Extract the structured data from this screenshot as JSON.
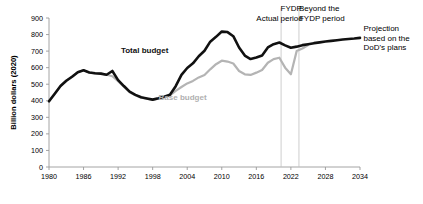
{
  "chart_data": {
    "type": "line",
    "title": "",
    "xlabel": "",
    "ylabel": "Billion dollars (2020)",
    "xlim": [
      1980,
      2034
    ],
    "ylim": [
      0,
      900
    ],
    "xticks": [
      1980,
      1986,
      1992,
      1998,
      2004,
      2010,
      2016,
      2022,
      2028,
      2034
    ],
    "yticks": [
      0,
      100,
      200,
      300,
      400,
      500,
      600,
      700,
      800,
      900
    ],
    "grid": false,
    "legend_position": "inline-labels",
    "series": [
      {
        "name": "Total budget",
        "color": "#111111",
        "x": [
          1980,
          1981,
          1982,
          1983,
          1984,
          1985,
          1986,
          1987,
          1988,
          1989,
          1990,
          1991,
          1992,
          1993,
          1994,
          1995,
          1996,
          1997,
          1998,
          1999,
          2000,
          2001,
          2002,
          2003,
          2004,
          2005,
          2006,
          2007,
          2008,
          2009,
          2010,
          2011,
          2012,
          2013,
          2014,
          2015,
          2016,
          2017,
          2018,
          2019,
          2020,
          2021,
          2022,
          2023,
          2024,
          2025,
          2026,
          2027,
          2028,
          2029,
          2030,
          2031,
          2032,
          2033,
          2034
        ],
        "y": [
          397,
          443,
          489,
          521,
          545,
          573,
          584,
          571,
          566,
          564,
          557,
          580,
          525,
          489,
          455,
          436,
          421,
          414,
          407,
          415,
          425,
          437,
          488,
          556,
          598,
          626,
          669,
          702,
          757,
          786,
          818,
          815,
          790,
          722,
          673,
          652,
          661,
          674,
          722,
          742,
          752,
          735,
          720,
          727,
          736,
          742,
          748,
          753,
          758,
          762,
          766,
          770,
          773,
          776,
          780
        ]
      },
      {
        "name": "Base budget",
        "color": "#b4b4b4",
        "x": [
          1980,
          1981,
          1982,
          1983,
          1984,
          1985,
          1986,
          1987,
          1988,
          1989,
          1990,
          1991,
          1992,
          1993,
          1994,
          1995,
          1996,
          1997,
          1998,
          1999,
          2000,
          2001,
          2002,
          2003,
          2004,
          2005,
          2006,
          2007,
          2008,
          2009,
          2010,
          2011,
          2012,
          2013,
          2014,
          2015,
          2016,
          2017,
          2018,
          2019,
          2020,
          2021,
          2022,
          2023,
          2024,
          2025
        ],
        "y": [
          397,
          443,
          489,
          521,
          545,
          573,
          584,
          571,
          566,
          564,
          557,
          548,
          518,
          485,
          452,
          434,
          419,
          412,
          405,
          413,
          423,
          432,
          460,
          483,
          505,
          520,
          541,
          556,
          590,
          621,
          642,
          637,
          625,
          580,
          560,
          556,
          570,
          586,
          630,
          652,
          660,
          600,
          560,
          700,
          716,
          736
        ]
      }
    ],
    "annotations": [
      {
        "name": "total-budget-label",
        "text": "Total budget",
        "x": 1996.6,
        "y": 690,
        "style": "dark"
      },
      {
        "name": "base-budget-label",
        "text": "Base budget",
        "x": 2003.2,
        "y": 405,
        "style": "light"
      },
      {
        "name": "actual-label",
        "text": "Actual",
        "x": 2016.0,
        "y": 880,
        "style": "plain"
      },
      {
        "name": "fydp-period-label",
        "text": "FYDP\nperiod",
        "x": 2020.2,
        "y": 940,
        "style": "plain"
      },
      {
        "name": "beyond-fydp-label",
        "text": "Beyond the\nFYDP period",
        "x": 2023.4,
        "y": 940,
        "style": "plain"
      },
      {
        "name": "projection-note",
        "text": "Projection\nbased on the\nDoD's plans",
        "x": 2034.6,
        "y": 820,
        "style": "plain"
      }
    ],
    "dividers": [
      {
        "name": "actual-fydp-divider",
        "x": 2020.3
      },
      {
        "name": "fydp-beyond-divider",
        "x": 2023.4
      }
    ]
  }
}
